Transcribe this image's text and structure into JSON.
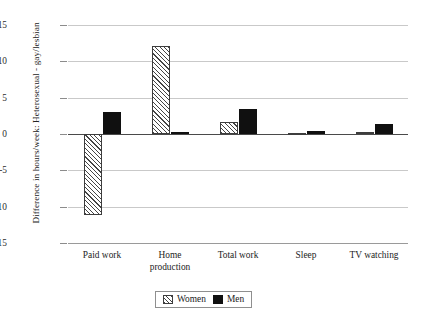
{
  "chart_data": {
    "type": "bar",
    "title": "",
    "subtitle": "",
    "xlabel": "",
    "ylabel": "Difference in hours/week: Heterosexual - gay/lesbian",
    "categories": [
      "Paid work",
      "Home production",
      "Total work",
      "Sleep",
      "TV watching"
    ],
    "category_lines": [
      [
        "Paid work"
      ],
      [
        "Home",
        "production"
      ],
      [
        "Total work"
      ],
      [
        "Sleep"
      ],
      [
        "TV watching"
      ]
    ],
    "series": [
      {
        "name": "Women",
        "values": [
          -11.2,
          12.1,
          1.6,
          0.1,
          0.3
        ],
        "fill": "hatched",
        "color": "#ffffff",
        "edge": "#3d3d3d"
      },
      {
        "name": "Men",
        "values": [
          3.0,
          0.3,
          3.4,
          0.4,
          1.4
        ],
        "fill": "solid",
        "color": "#101010",
        "edge": "#101010"
      }
    ],
    "ylim": [
      -15,
      15
    ],
    "yticks": [
      15,
      10,
      5,
      0,
      -5,
      -10,
      -15
    ],
    "ytick_labels": [
      "15",
      "10",
      "5",
      "0",
      "-5",
      "-10",
      "-15"
    ],
    "grid": true,
    "grid_axis": "y",
    "zero_line": true,
    "legend_position": "bottom-center",
    "legend_entries": [
      "Women",
      "Men"
    ]
  },
  "colors": {
    "grid": "#c9c9c9",
    "zero_line": "#4a4a4a",
    "men_bar": "#101010",
    "women_bar_edge": "#3d3d3d",
    "text": "#232323",
    "background": "#ffffff"
  }
}
